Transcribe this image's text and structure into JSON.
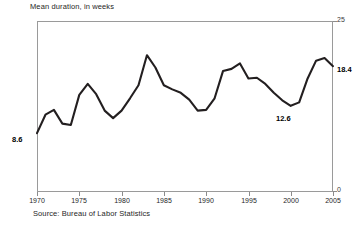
{
  "chart_data": {
    "type": "line",
    "title": "Mean duration, in weeks",
    "subtitle": "",
    "xlabel": "",
    "ylabel": "",
    "source": "Source: Bureau of Labor Statistics",
    "xlim": [
      1970,
      2005
    ],
    "ylim": [
      0,
      25
    ],
    "yticks": [
      0,
      25
    ],
    "ytick_labels": [
      "0",
      "25"
    ],
    "xticks": [
      1970,
      1975,
      1980,
      1985,
      1990,
      1995,
      2000,
      2005
    ],
    "xtick_labels": [
      "1970",
      "1975",
      "1980",
      "1985",
      "1990",
      "1995",
      "2000",
      "2005"
    ],
    "grid": false,
    "legend": false,
    "legend_position": "none",
    "line_color": "#231f20",
    "frame_color": "#9a9a9a",
    "x": [
      1970,
      1971,
      1972,
      1973,
      1974,
      1975,
      1976,
      1977,
      1978,
      1979,
      1980,
      1981,
      1982,
      1983,
      1984,
      1985,
      1986,
      1987,
      1988,
      1989,
      1990,
      1991,
      1992,
      1993,
      1994,
      1995,
      1996,
      1997,
      1998,
      1999,
      2000,
      2001,
      2002,
      2003,
      2004,
      2005
    ],
    "values": [
      8.6,
      11.3,
      12.0,
      10.0,
      9.8,
      14.2,
      15.8,
      14.3,
      11.9,
      10.8,
      11.9,
      13.7,
      15.6,
      20.0,
      18.2,
      15.6,
      15.0,
      14.5,
      13.5,
      11.9,
      12.0,
      13.7,
      17.7,
      18.0,
      18.8,
      16.6,
      16.7,
      15.8,
      14.5,
      13.4,
      12.6,
      13.1,
      16.6,
      19.2,
      19.6,
      18.4
    ],
    "annotations": [
      {
        "label": "8.6",
        "x": 1970,
        "y": 8.6,
        "position": "left"
      },
      {
        "label": "12.6",
        "x": 2000,
        "y": 12.6,
        "position": "below"
      },
      {
        "label": "18.4",
        "x": 2005,
        "y": 18.4,
        "position": "right"
      }
    ]
  }
}
